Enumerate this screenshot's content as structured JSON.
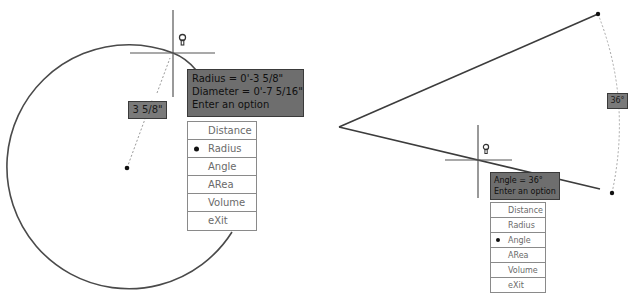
{
  "left_panel": {
    "tooltip": {
      "lines": [
        "Radius = 0'-3 5/8\"",
        "Diameter = 0'-7 5/16\"",
        "Enter an option"
      ]
    },
    "dimension_label": "3 5/8\"",
    "menu": {
      "items": [
        "Distance",
        "Radius",
        "Angle",
        "ARea",
        "Volume",
        "eXit"
      ],
      "selected": "Radius"
    },
    "icons": {
      "cursor": "crosshair-cursor-icon",
      "hint": "lightbulb-hint-icon"
    }
  },
  "right_panel": {
    "tooltip": {
      "lines": [
        "Angle = 36°",
        "Enter an option"
      ]
    },
    "angle_label": "36°",
    "menu": {
      "items": [
        "Distance",
        "Radius",
        "Angle",
        "ARea",
        "Volume",
        "eXit"
      ],
      "selected": "Angle"
    },
    "icons": {
      "cursor": "crosshair-cursor-icon",
      "hint": "lightbulb-hint-icon"
    }
  },
  "colors": {
    "geometry": "#3c3c3c",
    "tooltip_bg": "#6e6e6e",
    "menu_border": "#8a8a8a",
    "menu_text": "#6a6a6a"
  }
}
